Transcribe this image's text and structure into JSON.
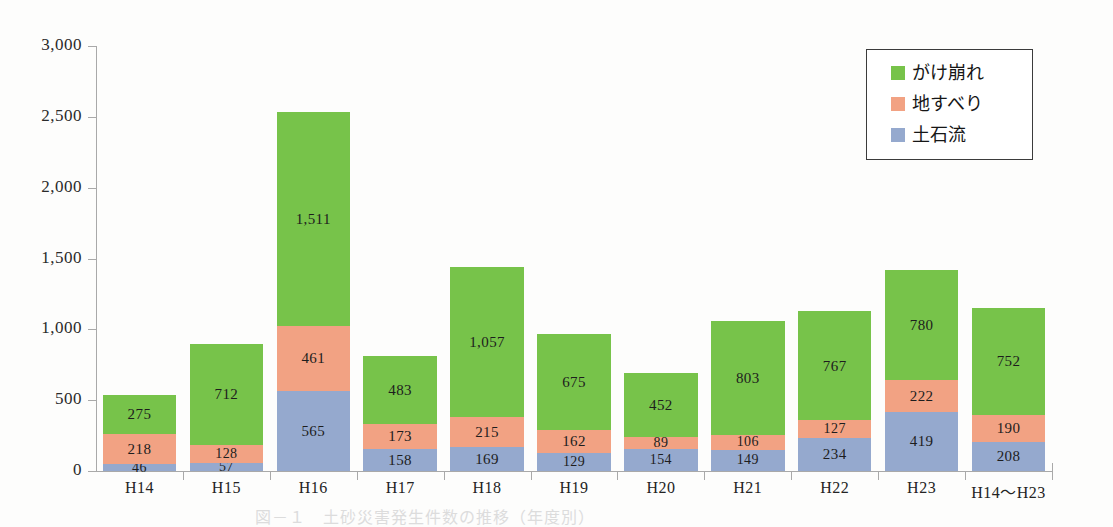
{
  "chart_data": {
    "type": "bar",
    "subtype": "stacked-column",
    "title": "",
    "xlabel": "",
    "ylabel": "",
    "ylim": [
      0,
      3000
    ],
    "ytick_values": [
      0,
      500,
      1000,
      1500,
      2000,
      2500,
      3000
    ],
    "ytick_labels": [
      "0",
      "500",
      "1,000",
      "1,500",
      "2,000",
      "2,500",
      "3,000"
    ],
    "grid": false,
    "legend_position": "top-right",
    "categories": [
      "H14",
      "H15",
      "H16",
      "H17",
      "H18",
      "H19",
      "H20",
      "H21",
      "H22",
      "H23",
      "H14～H23"
    ],
    "series": [
      {
        "name": "土石流",
        "color": "#95a9ce",
        "values": [
          46,
          57,
          565,
          158,
          169,
          129,
          154,
          149,
          234,
          419,
          208
        ],
        "labels": [
          "46",
          "57",
          "565",
          "158",
          "169",
          "129",
          "154",
          "149",
          "234",
          "419",
          "208"
        ]
      },
      {
        "name": "地すべり",
        "color": "#f2a283",
        "values": [
          218,
          128,
          461,
          173,
          215,
          162,
          89,
          106,
          127,
          222,
          190
        ],
        "labels": [
          "218",
          "128",
          "461",
          "173",
          "215",
          "162",
          "89",
          "106",
          "127",
          "222",
          "190"
        ]
      },
      {
        "name": "がけ崩れ",
        "color": "#77c34a",
        "values": [
          275,
          712,
          1511,
          483,
          1057,
          675,
          452,
          803,
          767,
          780,
          752
        ],
        "labels": [
          "275",
          "712",
          "1,511",
          "483",
          "1,057",
          "675",
          "452",
          "803",
          "767",
          "780",
          "752"
        ]
      }
    ],
    "totals": [
      539,
      897,
      2537,
      814,
      1441,
      966,
      695,
      1058,
      1128,
      1421,
      1150
    ]
  },
  "legend": {
    "entries": [
      {
        "label": "がけ崩れ",
        "color": "#77c34a"
      },
      {
        "label": "地すべり",
        "color": "#f2a283"
      },
      {
        "label": "土石流",
        "color": "#95a9ce"
      }
    ]
  },
  "caption": {
    "text": "図－１　土砂災害発生件数の推移（年度別）"
  },
  "colors": {
    "green": "#77c34a",
    "salmon": "#f2a283",
    "blue": "#95a9ce",
    "axis": "#a9a9a9",
    "text": "#1d1d1d",
    "background": "#fdfdfc"
  }
}
